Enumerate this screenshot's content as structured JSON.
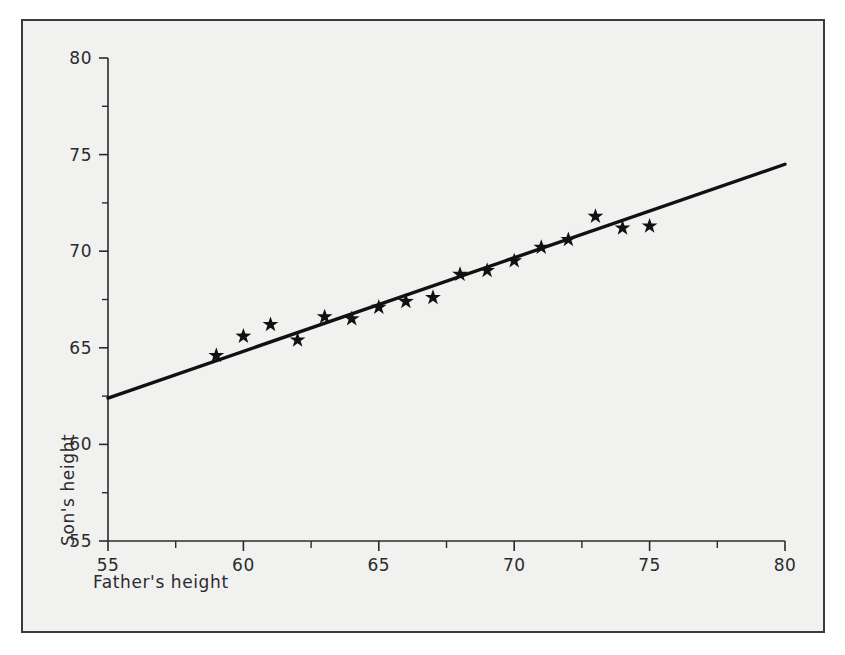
{
  "figure": {
    "background_color": "#f1f1f0",
    "frame_color": "#3b3b3b",
    "ink_color": "#111111"
  },
  "chart_data": {
    "type": "scatter",
    "title": "",
    "xlabel": "Father's height",
    "ylabel": "Son's height",
    "xlim": [
      55,
      80
    ],
    "ylim": [
      55,
      80
    ],
    "xticks": [
      55,
      60,
      65,
      70,
      75,
      80
    ],
    "yticks": [
      55,
      60,
      65,
      70,
      75,
      80
    ],
    "xtick_labels": [
      "55",
      "60",
      "65",
      "70",
      "75",
      "80"
    ],
    "ytick_labels": [
      "55",
      "60",
      "65",
      "70",
      "75",
      "80"
    ],
    "xminor_ticks": [
      57.5,
      62.5,
      67.5,
      72.5,
      77.5
    ],
    "yminor_ticks": [
      57.5,
      62.5,
      67.5,
      72.5,
      77.5
    ],
    "grid": false,
    "legend": null,
    "marker": "star",
    "x": [
      59,
      60,
      61,
      62,
      63,
      64,
      65,
      66,
      67,
      68,
      69,
      70,
      71,
      72,
      73,
      74,
      75
    ],
    "y": [
      64.6,
      65.6,
      66.2,
      65.4,
      66.6,
      66.5,
      67.1,
      67.4,
      67.6,
      68.8,
      69.0,
      69.5,
      70.2,
      70.6,
      71.8,
      71.2,
      71.3
    ],
    "series": [
      {
        "name": "observations",
        "marker": "star",
        "values": [
          64.6,
          65.6,
          66.2,
          65.4,
          66.6,
          66.5,
          67.1,
          67.4,
          67.6,
          68.8,
          69.0,
          69.5,
          70.2,
          70.6,
          71.8,
          71.2,
          71.3
        ]
      },
      {
        "name": "regression-line",
        "type": "line",
        "x_endpoints": [
          55,
          80
        ],
        "y_endpoints": [
          62.4,
          74.5
        ]
      }
    ],
    "annotations": []
  }
}
